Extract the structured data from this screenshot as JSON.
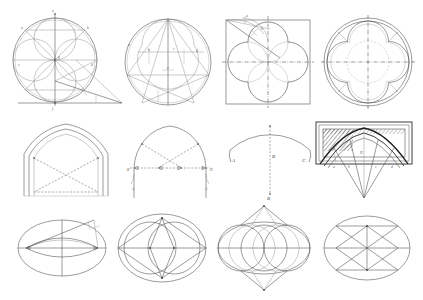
{
  "plate": {
    "title": "Geometric constructions for Gothic tracery, arches and ellipses",
    "background_color": "#ffffff",
    "ink_color": "#4a4a4a",
    "dark_ink_color": "#1f1f1f",
    "light_ink_color": "#9a9a9a",
    "columns": 4,
    "rows": 3,
    "width": 423,
    "height": 300
  },
  "figures": [
    {
      "id": "fig-r1c1",
      "row": 1,
      "col": 1,
      "name": "quatrefoil-construction-with-baseline",
      "kind": "circle-construction",
      "description": "Large circle with four inscribed tangent circles, diagonal chords, vertical axis and an extended horizontal baseline terminating in a long shallow triangle to the right",
      "labels": [
        "a",
        "b",
        "c",
        "d",
        "e",
        "f",
        "g"
      ]
    },
    {
      "id": "fig-r1c2",
      "row": 1,
      "col": 2,
      "name": "cinquefoil-pentagon-construction",
      "kind": "circle-construction",
      "description": "Circle containing a five-pointed star / pentagon construction with arcs forming cinquefoil lobes",
      "labels": [
        "a",
        "b",
        "c",
        "d",
        "e"
      ]
    },
    {
      "id": "fig-r1c3",
      "row": 1,
      "col": 3,
      "name": "quatrefoil-in-square",
      "kind": "square-construction",
      "description": "Quatrefoil with cusps inscribed in a square, dash-dot vertical and horizontal centre axes, corner construction lines at upper left",
      "labels": [
        "a",
        "b"
      ]
    },
    {
      "id": "fig-r1c4",
      "row": 1,
      "col": 4,
      "name": "quatrefoil-rose-window-in-circle",
      "kind": "circle-construction",
      "description": "Double-ringed circle enclosing a cusped quatrefoil with inner dashed circle and dash-dot centre axes",
      "labels": []
    },
    {
      "id": "fig-r2c1",
      "row": 2,
      "col": 1,
      "name": "pointed-arch-moulding-profile",
      "kind": "arch",
      "description": "Equilateral pointed arch drawn with three concentric mouldings and dashed construction chords from springing points to apex and base",
      "labels": []
    },
    {
      "id": "fig-r2c2",
      "row": 2,
      "col": 2,
      "name": "four-centred-arch-construction",
      "kind": "arch",
      "description": "Depressed four-centred arch on vertical jambs with dashed springing line, centre points marked by arrowheads and crossing construction diagonals",
      "labels": [
        "B",
        "D",
        "A",
        "A"
      ]
    },
    {
      "id": "fig-r2c3",
      "row": 2,
      "col": 3,
      "name": "segmental-arch-radius-construction",
      "kind": "arch",
      "description": "Shallow segmental arch with long dotted vertical radius line dropping from crown to a remote centre point",
      "labels": [
        "A",
        "C",
        "B",
        "B"
      ]
    },
    {
      "id": "fig-r2c4",
      "row": 2,
      "col": 4,
      "name": "vault-rib-setting-out",
      "kind": "vault",
      "description": "Rectangular vault bay in elevation with hatched masonry border, heavy curved ribs and radiating setting-out lines converging on a point below",
      "labels": [
        "a",
        "b",
        "c",
        "d",
        "H"
      ]
    },
    {
      "id": "fig-r3c1",
      "row": 3,
      "col": 1,
      "name": "ellipse-by-trammel-method",
      "kind": "ellipse-construction",
      "description": "Ellipse with major and minor axes, two inner arcs forming a vesica, and an oblique trammel line to the upper right with tick marks",
      "labels": []
    },
    {
      "id": "fig-r3c2",
      "row": 3,
      "col": 2,
      "name": "ellipse-by-three-circle-method",
      "kind": "ellipse-construction",
      "description": "Ellipse with horizontal axis, two overlapping circles forming a central vesica and chords from the axis ends to the top and bottom vertices",
      "labels": []
    },
    {
      "id": "fig-r3c3",
      "row": 3,
      "col": 3,
      "name": "ellipse-by-four-arc-method",
      "kind": "ellipse-construction",
      "description": "Ellipse containing four overlapping circles whose intersecting tangents form tall pointed apexes above and below the figure",
      "labels": []
    },
    {
      "id": "fig-r3c4",
      "row": 3,
      "col": 4,
      "name": "ellipse-by-rectangle-method",
      "kind": "ellipse-construction",
      "description": "Ellipse with an inscribed rectangle divided by horizontal chords and crossing diagonals forming triangles",
      "labels": []
    }
  ]
}
